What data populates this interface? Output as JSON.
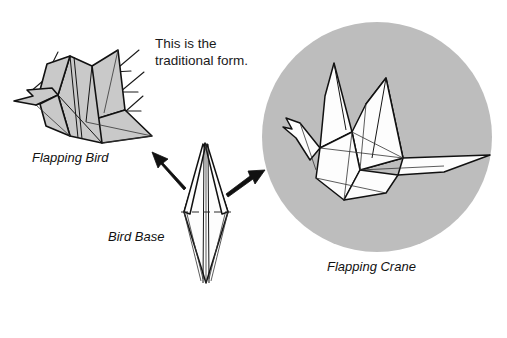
{
  "page": {
    "background_color": "#ffffff"
  },
  "caption": {
    "line1": "This is the",
    "line2": "traditional form."
  },
  "figures": [
    {
      "id": "flapping-bird",
      "label": "Flapping Bird",
      "fill_color": "#c9c9c9",
      "has_motion_lines": true
    },
    {
      "id": "bird-base",
      "label": "Bird Base",
      "fill_color": "#ffffff",
      "has_motion_lines": false
    },
    {
      "id": "flapping-crane",
      "label": "Flapping Crane",
      "fill_color": "#fdfdfd",
      "halo_color": "#bdbdbd",
      "has_motion_lines": false
    }
  ],
  "arrows": [
    {
      "id": "arrow-to-flapping-bird",
      "direction": "up-left"
    },
    {
      "id": "arrow-to-flapping-crane",
      "direction": "up-right"
    }
  ],
  "colors": {
    "ink": "#111111",
    "paper_gray": "#c9c9c9",
    "halo_gray": "#bdbdbd",
    "paper_white": "#fdfdfd"
  }
}
